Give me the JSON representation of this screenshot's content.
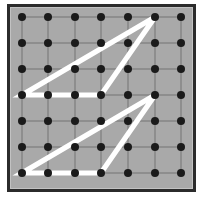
{
  "figure": {
    "title": "Geoboard with two congruent triangles",
    "caption": "",
    "board": {
      "background_color": "#a9a9a9",
      "frame_color": "#2b2b2b",
      "peg_color": "#1a1a1a",
      "grid_line_color": "#6d6d6d",
      "band_color": "#ffffff",
      "page_background": "#ffffff",
      "rows": 7,
      "columns": 7,
      "peg_count": 49,
      "peg_radius": 4,
      "band_width": 5,
      "grid_visible": true
    }
  },
  "chart_data": {
    "type": "scatter",
    "title": "Geoboard with two congruent triangles",
    "xlabel": "",
    "ylabel": "",
    "xlim": [
      1,
      7
    ],
    "ylim": [
      1,
      7
    ],
    "grid": true,
    "legend": "none",
    "peg_grid": {
      "columns": [
        1,
        2,
        3,
        4,
        5,
        6,
        7
      ],
      "rows": [
        1,
        2,
        3,
        4,
        5,
        6,
        7
      ],
      "x_pixels": [
        22,
        48,
        75,
        101,
        128,
        155,
        181
      ],
      "y_pixels": [
        17,
        43,
        69,
        95,
        121,
        147,
        173
      ],
      "spacing_px": 26.4
    },
    "shapes": [
      {
        "name": "upper-triangle",
        "kind": "triangle",
        "stroke": "#ffffff",
        "fill": "none",
        "vertices_grid": [
          {
            "col": 1,
            "row": 4
          },
          {
            "col": 4,
            "row": 4
          },
          {
            "col": 6,
            "row": 1
          }
        ],
        "vertices_px": [
          {
            "x": 22,
            "y": 95
          },
          {
            "x": 101,
            "y": 95
          },
          {
            "x": 155,
            "y": 17
          }
        ],
        "base_units": 3,
        "height_units": 3,
        "apex_offset_units": 5
      },
      {
        "name": "lower-triangle",
        "kind": "triangle",
        "stroke": "#ffffff",
        "fill": "none",
        "vertices_grid": [
          {
            "col": 1,
            "row": 7
          },
          {
            "col": 4,
            "row": 7
          },
          {
            "col": 6,
            "row": 4
          }
        ],
        "vertices_px": [
          {
            "x": 22,
            "y": 173
          },
          {
            "x": 101,
            "y": 173
          },
          {
            "x": 155,
            "y": 95
          }
        ],
        "base_units": 3,
        "height_units": 3,
        "apex_offset_units": 5
      }
    ]
  }
}
